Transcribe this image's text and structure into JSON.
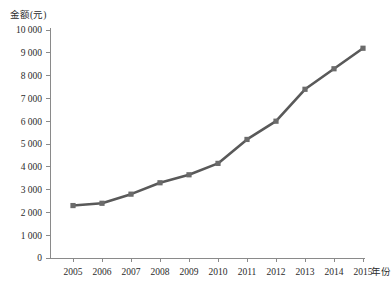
{
  "chart_data": {
    "type": "line",
    "title": "",
    "subtitle": "",
    "xlabel": "年份",
    "ylabel": "金额(元)",
    "categories": [
      "2005",
      "2006",
      "2007",
      "2008",
      "2009",
      "2010",
      "2011",
      "2012",
      "2013",
      "2014",
      "2015"
    ],
    "x": [
      2005,
      2006,
      2007,
      2008,
      2009,
      2010,
      2011,
      2012,
      2013,
      2014,
      2015
    ],
    "values": [
      2300,
      2400,
      2800,
      3300,
      3650,
      4150,
      5200,
      6000,
      7400,
      8300,
      9200
    ],
    "series": [
      {
        "name": "金额",
        "values": [
          2300,
          2400,
          2800,
          3300,
          3650,
          4150,
          5200,
          6000,
          7400,
          8300,
          9200
        ]
      }
    ],
    "xlim": [
      2004.5,
      2015.5
    ],
    "ylim": [
      0,
      10000
    ],
    "ytick_values": [
      0,
      1000,
      2000,
      3000,
      4000,
      5000,
      6000,
      7000,
      8000,
      9000,
      10000
    ],
    "ytick_labels": [
      "0",
      "1 000",
      "2 000",
      "3 000",
      "4 000",
      "5 000",
      "6 000",
      "7 000",
      "8 000",
      "9 000",
      "10 000"
    ],
    "xtick_labels": [
      "2005",
      "2006",
      "2007",
      "2008",
      "2009",
      "2010",
      "2011",
      "2012",
      "2013",
      "2014",
      "2015"
    ],
    "grid": false,
    "legend": false,
    "legend_position": "none",
    "marker": "square",
    "line_color": "#595959",
    "marker_color": "#6b6b6b",
    "axis_color": "#8a8a8a",
    "background_color": "#ffffff",
    "annotations": []
  }
}
